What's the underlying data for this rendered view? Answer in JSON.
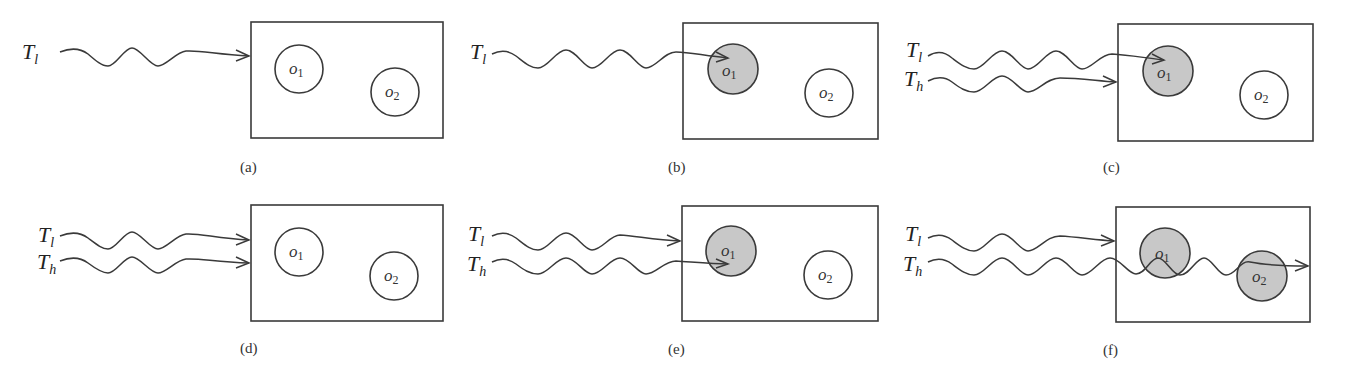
{
  "figure": {
    "panels": [
      {
        "id": "a",
        "caption": "(a)",
        "transactions": [
          {
            "label": "T",
            "sub": "l",
            "target": "box-edge"
          }
        ],
        "objects": [
          {
            "label": "o",
            "sub": "1",
            "state": "unlocked"
          },
          {
            "label": "o",
            "sub": "2",
            "state": "unlocked"
          }
        ]
      },
      {
        "id": "b",
        "caption": "(b)",
        "transactions": [
          {
            "label": "T",
            "sub": "l",
            "target": "o1"
          }
        ],
        "objects": [
          {
            "label": "o",
            "sub": "1",
            "state": "locked"
          },
          {
            "label": "o",
            "sub": "2",
            "state": "unlocked"
          }
        ]
      },
      {
        "id": "c",
        "caption": "(c)",
        "transactions": [
          {
            "label": "T",
            "sub": "l",
            "target": "o1"
          },
          {
            "label": "T",
            "sub": "h",
            "target": "box-edge"
          }
        ],
        "objects": [
          {
            "label": "o",
            "sub": "1",
            "state": "locked"
          },
          {
            "label": "o",
            "sub": "2",
            "state": "unlocked"
          }
        ]
      },
      {
        "id": "d",
        "caption": "(d)",
        "transactions": [
          {
            "label": "T",
            "sub": "l",
            "target": "box-edge"
          },
          {
            "label": "T",
            "sub": "h",
            "target": "box-edge"
          }
        ],
        "objects": [
          {
            "label": "o",
            "sub": "1",
            "state": "unlocked"
          },
          {
            "label": "o",
            "sub": "2",
            "state": "unlocked"
          }
        ]
      },
      {
        "id": "e",
        "caption": "(e)",
        "transactions": [
          {
            "label": "T",
            "sub": "l",
            "target": "box-edge"
          },
          {
            "label": "T",
            "sub": "h",
            "target": "o1"
          }
        ],
        "objects": [
          {
            "label": "o",
            "sub": "1",
            "state": "locked"
          },
          {
            "label": "o",
            "sub": "2",
            "state": "unlocked"
          }
        ]
      },
      {
        "id": "f",
        "caption": "(f)",
        "transactions": [
          {
            "label": "T",
            "sub": "l",
            "target": "box-edge"
          },
          {
            "label": "T",
            "sub": "h",
            "target": "through-o1-o2"
          }
        ],
        "objects": [
          {
            "label": "o",
            "sub": "1",
            "state": "locked"
          },
          {
            "label": "o",
            "sub": "2",
            "state": "locked"
          }
        ]
      }
    ],
    "colors": {
      "stroke": "#3a3a3a",
      "locked_fill": "#c8c8c8",
      "unlocked_fill": "#ffffff",
      "background": "#ffffff"
    }
  }
}
